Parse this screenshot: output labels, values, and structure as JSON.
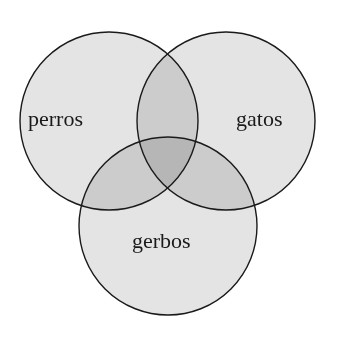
{
  "diagram": {
    "type": "venn",
    "sets": [
      {
        "id": "perros",
        "label": "perros",
        "cx": 109,
        "cy": 121,
        "r": 89
      },
      {
        "id": "gatos",
        "label": "gatos",
        "cx": 226,
        "cy": 121,
        "r": 89
      },
      {
        "id": "gerbos",
        "label": "gerbos",
        "cx": 168,
        "cy": 226,
        "r": 89
      }
    ],
    "colors": {
      "background": "#ffffff",
      "single_region": "#e4e4e4",
      "double_overlap": "#c2c2c2",
      "triple_overlap": "#a8a8a8",
      "stroke": "#1a1a1a"
    }
  }
}
